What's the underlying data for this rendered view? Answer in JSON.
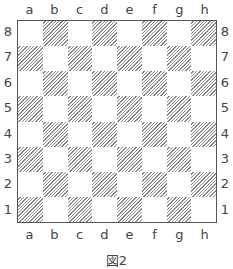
{
  "diagram": {
    "type": "chessboard",
    "files": [
      "a",
      "b",
      "c",
      "d",
      "e",
      "f",
      "g",
      "h"
    ],
    "ranks": [
      "8",
      "7",
      "6",
      "5",
      "4",
      "3",
      "2",
      "1"
    ],
    "dark_square_style": "diagonal-hatch",
    "colors": {
      "border": "#555555",
      "hatch": "#8a8a8a",
      "light": "#ffffff",
      "label": "#444444"
    },
    "pieces": []
  },
  "caption": "図2"
}
